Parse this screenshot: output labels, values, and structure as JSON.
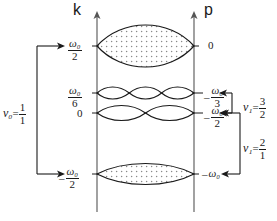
{
  "figure": {
    "axes": {
      "left_axis_label": "k",
      "right_axis_label": "p"
    },
    "left_ticks": [
      {
        "id": "k-top",
        "text": "ω₀/2",
        "num": "ω₀",
        "den": "2",
        "sign": "",
        "y": 46
      },
      {
        "id": "k-mid-high",
        "text": "ω₀/6",
        "num": "ω₀",
        "den": "6",
        "sign": "",
        "y": 93
      },
      {
        "id": "k-zero",
        "text": "0",
        "num": "0",
        "den": "",
        "sign": "",
        "y": 113
      },
      {
        "id": "k-bottom",
        "text": "-ω₀/2",
        "num": "ω₀",
        "den": "2",
        "sign": "–",
        "y": 174
      }
    ],
    "right_ticks": [
      {
        "id": "p-top",
        "text": "0",
        "num": "0",
        "den": "",
        "sign": "",
        "y": 46
      },
      {
        "id": "p-mid-high",
        "text": "-ω₀/3",
        "num": "ω₀",
        "den": "3",
        "sign": "–",
        "y": 93
      },
      {
        "id": "p-mid-low",
        "text": "-ω₀/2",
        "num": "ω₀",
        "den": "2",
        "sign": "–",
        "y": 113
      },
      {
        "id": "p-bottom",
        "text": "-ω₀",
        "num": "ω₀",
        "den": "",
        "sign": "–",
        "y": 174
      }
    ],
    "left_bracket": {
      "label_symbol": "ν₀",
      "equals": "=",
      "num": "1",
      "den": "1",
      "full_text": "ν₀ = 1/1",
      "span_from_y": 46,
      "span_to_y": 174
    },
    "right_brackets": [
      {
        "id": "nu1-3-2",
        "label_symbol": "ν₁",
        "equals": "=",
        "num": "3",
        "den": "2",
        "full_text": "ν₁ = 3/2",
        "span_from_y": 93,
        "span_to_y": 113
      },
      {
        "id": "nu1-2-1",
        "label_symbol": "ν₁",
        "equals": "=",
        "num": "2",
        "den": "1",
        "full_text": "ν₁ = 2/1",
        "span_from_y": 113,
        "span_to_y": 174
      }
    ],
    "bands": [
      {
        "id": "band-top",
        "center_y": 46,
        "lobes": 1,
        "half_height": 22,
        "filled": true,
        "label_left": "ω₀/2",
        "label_right": "0"
      },
      {
        "id": "band-mid-high",
        "center_y": 93,
        "lobes": 3,
        "half_height": 5,
        "filled": false,
        "label_left": "ω₀/6",
        "label_right": "-ω₀/3"
      },
      {
        "id": "band-mid-low",
        "center_y": 113,
        "lobes": 2,
        "half_height": 7,
        "filled": false,
        "label_left": "0",
        "label_right": "-ω₀/2"
      },
      {
        "id": "band-bottom",
        "center_y": 174,
        "lobes": 1,
        "half_height": 11,
        "filled": true,
        "label_left": "-ω₀/2",
        "label_right": "-ω₀"
      }
    ],
    "colors": {
      "ink": "#1a1a1a",
      "axis": "#555555",
      "fill_dot": "#8a8a8a",
      "background": "#ffffff"
    }
  }
}
